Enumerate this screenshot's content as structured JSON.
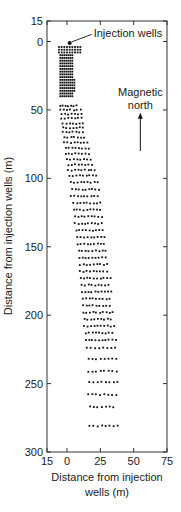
{
  "chart_data": {
    "type": "scatter",
    "title": "",
    "xlabel_lines": [
      "Distance from injection",
      "wells (m)"
    ],
    "ylabel": "Distance from injection wells (m)",
    "xlim": [
      -15,
      75
    ],
    "ylim": [
      300,
      -15
    ],
    "y_inverted": true,
    "x_ticks": [
      {
        "value": -15,
        "label": "15"
      },
      {
        "value": 0,
        "label": "0"
      },
      {
        "value": 25,
        "label": "25"
      },
      {
        "value": 50,
        "label": "50"
      },
      {
        "value": 75,
        "label": "75"
      }
    ],
    "y_ticks": [
      {
        "value": -15,
        "label": "15"
      },
      {
        "value": 0,
        "label": "0"
      },
      {
        "value": 50,
        "label": "50"
      },
      {
        "value": 100,
        "label": "100"
      },
      {
        "value": 150,
        "label": "150"
      },
      {
        "value": 200,
        "label": "200"
      },
      {
        "value": 250,
        "label": "250"
      },
      {
        "value": 300,
        "label": "300"
      }
    ],
    "grid": false,
    "legend": null,
    "series": [
      {
        "name": "Injection wells",
        "marker": "filled-circle",
        "points": [
          [
            2,
            1
          ]
        ]
      },
      {
        "name": "Sample points (grid rows: y, x_start, x_end, step)",
        "marker": "small-square",
        "rows": [
          [
            4,
            -6,
            10,
            2
          ],
          [
            6,
            -6,
            10,
            2
          ],
          [
            8,
            -6,
            10,
            2
          ],
          [
            10,
            -5,
            4,
            1.5
          ],
          [
            12,
            -5,
            4,
            1.5
          ],
          [
            14,
            -5,
            5,
            1.5
          ],
          [
            16,
            -5,
            5,
            1.5
          ],
          [
            18,
            -5,
            5,
            1.5
          ],
          [
            20,
            -5,
            5,
            1.5
          ],
          [
            22,
            -5,
            5,
            1.5
          ],
          [
            24,
            -5,
            5,
            1.5
          ],
          [
            26,
            -5,
            5,
            1.5
          ],
          [
            28,
            -5,
            6,
            1.5
          ],
          [
            30,
            -5,
            6,
            1.5
          ],
          [
            32,
            -5,
            6,
            1.5
          ],
          [
            34,
            -5,
            6,
            1.5
          ],
          [
            36,
            -5,
            6,
            1.5
          ],
          [
            38,
            -5,
            5,
            1.5
          ],
          [
            40,
            -5,
            4,
            1.5
          ],
          [
            47,
            -5,
            8,
            2
          ],
          [
            50,
            -5,
            10,
            2.5
          ],
          [
            53,
            -4,
            12,
            2.5
          ],
          [
            56,
            -4,
            12,
            2.5
          ],
          [
            60,
            -3,
            14,
            2.5
          ],
          [
            63,
            -3,
            14,
            2.5
          ],
          [
            66,
            -3,
            14,
            2.5
          ],
          [
            70,
            -2,
            15,
            2.5
          ],
          [
            74,
            -2,
            16,
            2.5
          ],
          [
            78,
            -1,
            17,
            2.5
          ],
          [
            82,
            -1,
            18,
            2.5
          ],
          [
            86,
            0,
            19,
            2.5
          ],
          [
            90,
            1,
            20,
            2.5
          ],
          [
            94,
            1,
            22,
            2.5
          ],
          [
            98,
            2,
            23,
            2.5
          ],
          [
            103,
            3,
            23,
            2.5
          ],
          [
            108,
            4,
            24,
            2.5
          ],
          [
            113,
            3,
            25,
            2.5
          ],
          [
            118,
            5,
            26,
            2.5
          ],
          [
            123,
            5,
            27,
            2.5
          ],
          [
            128,
            6,
            28,
            2.5
          ],
          [
            133,
            6,
            28,
            2.5
          ],
          [
            138,
            7,
            29,
            2.5
          ],
          [
            143,
            8,
            30,
            2.5
          ],
          [
            148,
            8,
            30,
            2.5
          ],
          [
            153,
            9,
            31,
            2.5
          ],
          [
            158,
            9,
            31,
            2.5
          ],
          [
            163,
            10,
            32,
            2.5
          ],
          [
            168,
            10,
            32,
            2.5
          ],
          [
            173,
            10,
            33,
            2.5
          ],
          [
            178,
            11,
            33,
            2.5
          ],
          [
            183,
            11,
            34,
            2.5
          ],
          [
            188,
            12,
            34,
            2.5
          ],
          [
            193,
            12,
            34,
            2.5
          ],
          [
            198,
            12,
            35,
            2.5
          ],
          [
            203,
            13,
            35,
            2.5
          ],
          [
            208,
            13,
            36,
            2.5
          ],
          [
            213,
            14,
            36,
            2.5
          ],
          [
            218,
            14,
            37,
            2.5
          ],
          [
            224,
            15,
            38,
            3
          ],
          [
            232,
            16,
            38,
            3
          ],
          [
            241,
            16,
            38,
            3
          ],
          [
            249,
            17,
            40,
            3
          ],
          [
            258,
            16,
            37,
            3
          ],
          [
            267,
            17,
            37,
            3
          ],
          [
            281,
            17,
            38,
            3
          ]
        ]
      }
    ],
    "annotations": [
      {
        "text": "Injection wells",
        "x": 20,
        "y": -3,
        "arrow_to": [
          2,
          1
        ]
      },
      {
        "text_lines": [
          "Magnetic",
          "north"
        ],
        "x": 55,
        "y": 40,
        "arrow": "up",
        "arrow_from_y": 80,
        "arrow_to_y": 52
      }
    ]
  }
}
